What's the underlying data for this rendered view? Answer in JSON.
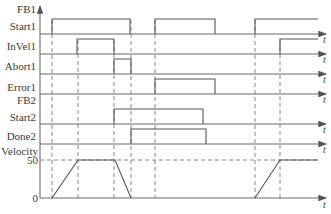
{
  "diagram": {
    "groups": [
      {
        "label": "FB1"
      },
      {
        "label": "FB2"
      }
    ],
    "signals": [
      {
        "label": "Start1",
        "group": "FB1",
        "pulses": [
          [
            52,
            130
          ],
          [
            155,
            215
          ],
          [
            255,
            318
          ]
        ]
      },
      {
        "label": "InVel1",
        "group": "FB1",
        "pulses": [
          [
            77,
            114
          ],
          [
            280,
            318
          ]
        ]
      },
      {
        "label": "Abort1",
        "group": "FB1",
        "pulses": [
          [
            114,
            131
          ]
        ]
      },
      {
        "label": "Error1",
        "group": "FB1",
        "pulses": [
          [
            155,
            215
          ]
        ]
      },
      {
        "label": "Start2",
        "group": "FB2",
        "pulses": [
          [
            114,
            203
          ]
        ]
      },
      {
        "label": "Done2",
        "group": "FB2",
        "pulses": [
          [
            131,
            206
          ]
        ]
      }
    ],
    "velocity": {
      "label": "Velocity",
      "ticks": [
        "50",
        "0"
      ],
      "profile": "ramp up to 50, hold, ramp down to 0; later ramp up to 50 and hold"
    },
    "time_axis_label": "t",
    "colors": {
      "line": "#555555",
      "dashed": "#7a7a7a",
      "text": "#3a3a3a"
    }
  }
}
